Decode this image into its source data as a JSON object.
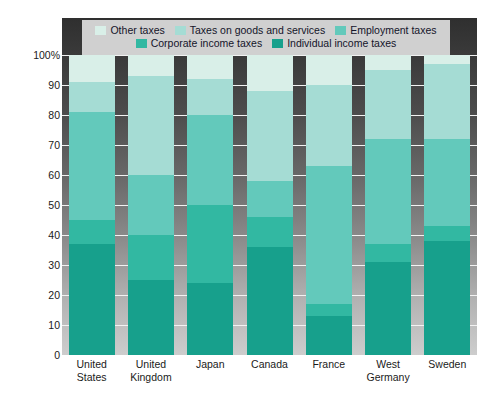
{
  "chart_data": {
    "type": "bar",
    "title": "",
    "subtitle": "",
    "xlabel": "",
    "ylabel": "Percentage of total tax revenue",
    "ylim": [
      0,
      100
    ],
    "ytick_labels": [
      "100%",
      "90",
      "80",
      "70",
      "60",
      "50",
      "40",
      "30",
      "20",
      "10",
      "0"
    ],
    "ytick_values": [
      100,
      90,
      80,
      70,
      60,
      50,
      40,
      30,
      20,
      10,
      0
    ],
    "grid": true,
    "stacked": true,
    "legend_position": "top",
    "categories": [
      "United States",
      "United Kingdom",
      "Japan",
      "Canada",
      "France",
      "West Germany",
      "Sweden"
    ],
    "series": [
      {
        "name": "Individual income taxes",
        "color": "#17a08c",
        "values": [
          37,
          25,
          24,
          36,
          13,
          31,
          38
        ]
      },
      {
        "name": "Corporate income taxes",
        "color": "#32b8a2",
        "values": [
          8,
          15,
          26,
          10,
          4,
          6,
          5
        ]
      },
      {
        "name": "Employment taxes",
        "color": "#63c9bb",
        "values": [
          36,
          20,
          30,
          12,
          46,
          35,
          29
        ]
      },
      {
        "name": "Taxes on goods and services",
        "color": "#a5dcd4",
        "values": [
          10,
          33,
          12,
          30,
          27,
          23,
          25
        ]
      },
      {
        "name": "Other taxes",
        "color": "#d9efe8",
        "values": [
          9,
          7,
          8,
          12,
          10,
          5,
          3
        ]
      }
    ]
  },
  "legend": {
    "row1": [
      {
        "label": "Other taxes",
        "color": "#d9efe8"
      },
      {
        "label": "Taxes on goods and services",
        "color": "#a5dcd4"
      },
      {
        "label": "Employment taxes",
        "color": "#63c9bb"
      }
    ],
    "row2": [
      {
        "label": "Corporate income taxes",
        "color": "#32b8a2"
      },
      {
        "label": "Individual income taxes",
        "color": "#17a08c"
      }
    ]
  },
  "theme": {
    "plot_bg_top": "#2f2f2f",
    "plot_bg_bottom": "#cdcdcd",
    "gridline_color": "#f2f2f2",
    "legend_bg": "#d0d0d0",
    "text_color": "#1a1a1a"
  }
}
